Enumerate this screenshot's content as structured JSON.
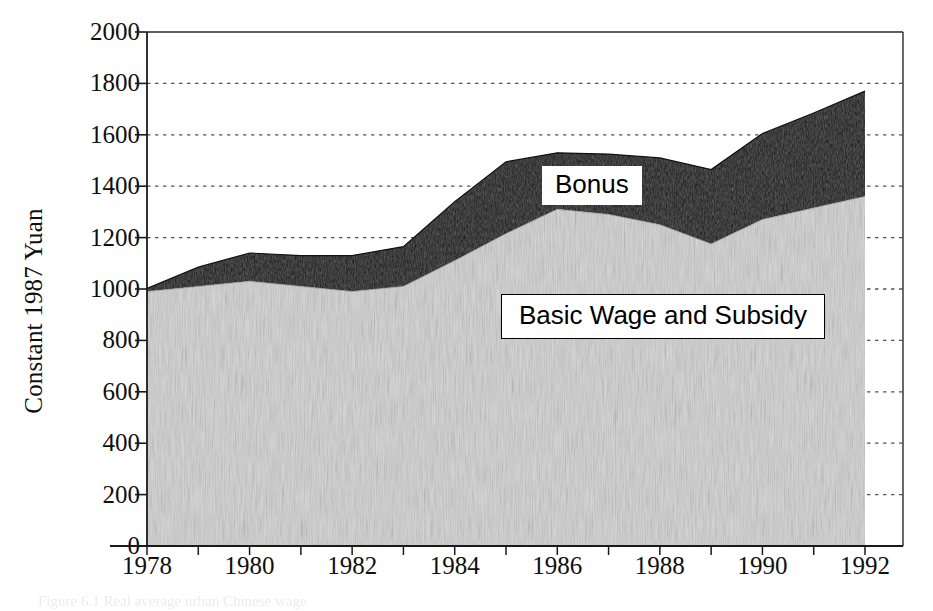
{
  "figure": {
    "y_axis_title": "Constant 1987 Yuan",
    "caption_remnant": "Figure 6.1 Real average urban Chinese wage",
    "colors": {
      "bonus_fill": "#111111",
      "basic_fill": "#d7d7d7",
      "axis": "#1a1a1a",
      "gridline": "#555555",
      "background": "#ffffff"
    }
  },
  "chart_data": {
    "type": "area",
    "title": "",
    "subtitle": "",
    "xlabel": "",
    "ylabel": "Constant 1987 Yuan",
    "stacked": true,
    "grid": true,
    "legend_position": "inline-on-plot",
    "xlim": [
      1978,
      1992
    ],
    "ylim": [
      0,
      2000
    ],
    "x_tick_labels": [
      "1978",
      "1980",
      "1982",
      "1984",
      "1986",
      "1988",
      "1990",
      "1992"
    ],
    "x_ticks": [
      1978,
      1980,
      1982,
      1984,
      1986,
      1988,
      1990,
      1992
    ],
    "x_minor_ticks": [
      1979,
      1981,
      1983,
      1985,
      1987,
      1989,
      1991
    ],
    "y_tick_labels": [
      "0",
      "200",
      "400",
      "600",
      "800",
      "1000",
      "1200",
      "1400",
      "1600",
      "1800",
      "2000"
    ],
    "y_ticks": [
      0,
      200,
      400,
      600,
      800,
      1000,
      1200,
      1400,
      1600,
      1800,
      2000
    ],
    "x": [
      1978,
      1979,
      1980,
      1981,
      1982,
      1983,
      1984,
      1985,
      1986,
      1987,
      1988,
      1989,
      1990,
      1991,
      1992
    ],
    "series": [
      {
        "name": "Basic Wage and Subsidy",
        "label": "Basic Wage and Subsidy",
        "color": "#d7d7d7",
        "values": [
          990,
          1010,
          1030,
          1010,
          990,
          1010,
          1110,
          1215,
          1310,
          1290,
          1250,
          1175,
          1270,
          1315,
          1360
        ]
      },
      {
        "name": "Bonus",
        "label": "Bonus",
        "color": "#111111",
        "values": [
          12,
          75,
          110,
          120,
          140,
          155,
          230,
          280,
          220,
          235,
          260,
          290,
          335,
          370,
          410
        ]
      }
    ],
    "totals": [
      1002,
      1085,
      1140,
      1130,
      1130,
      1165,
      1340,
      1495,
      1530,
      1525,
      1510,
      1465,
      1605,
      1685,
      1770
    ],
    "annotations": [
      {
        "text": "Bonus",
        "x": 1986.5,
        "y": 1430
      },
      {
        "text": "Basic Wage and Subsidy",
        "x": 1985.8,
        "y": 930
      }
    ]
  }
}
